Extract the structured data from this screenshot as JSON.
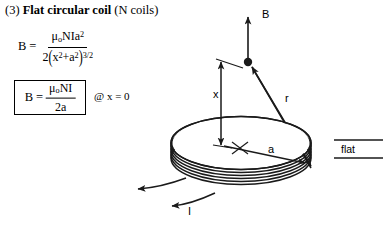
{
  "title": {
    "number": "(3)",
    "bold_text": "Flat circular coil",
    "suffix": "(N coils)"
  },
  "formulas": {
    "main": {
      "lhs": "B",
      "equals": "=",
      "numerator": "μ₀NIa²",
      "denominator": "2(x² + a²)³ᐟ²",
      "parts": {
        "mu": "μ",
        "mu_sub": "o",
        "N": "N",
        "I": "I",
        "a": "a",
        "a_exp": "2",
        "den_coeff": "2",
        "den_x": "x",
        "den_x_exp": "2",
        "den_plus": "+",
        "den_a": "a",
        "den_a_exp": "2",
        "den_power": "3/2"
      }
    },
    "boxed": {
      "lhs": "B",
      "equals": "=",
      "numerator_mu": "μ",
      "numerator_mu_sub": "o",
      "numerator_NI": "NI",
      "denominator": "2a"
    },
    "condition": "@ x = 0"
  },
  "diagram": {
    "labels": {
      "field_B": "B",
      "distance_x": "x",
      "distance_r": "r",
      "radius_a": "a",
      "current_I": "I",
      "flat": "flat"
    },
    "colors": {
      "stroke": "#1a1a1a",
      "background": "#ffffff"
    },
    "coil": {
      "turns": 6,
      "center_x": 241,
      "center_y": 150,
      "radius_x": 70,
      "radius_y": 27
    }
  }
}
